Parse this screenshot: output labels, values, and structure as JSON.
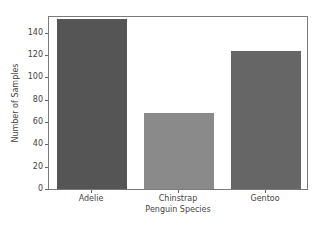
{
  "chart_data": {
    "type": "bar",
    "title": "",
    "categories": [
      "Adelie",
      "Chinstrap",
      "Gentoo"
    ],
    "values": [
      152,
      68,
      124
    ],
    "colors": [
      "#555555",
      "#8a8a8a",
      "#666666"
    ],
    "xlabel": "Penguin Species",
    "ylabel": "Number of Samples",
    "ylim": [
      0,
      156
    ],
    "yticks": [
      0,
      20,
      40,
      60,
      80,
      100,
      120,
      140
    ],
    "grid": false,
    "legend": null
  }
}
